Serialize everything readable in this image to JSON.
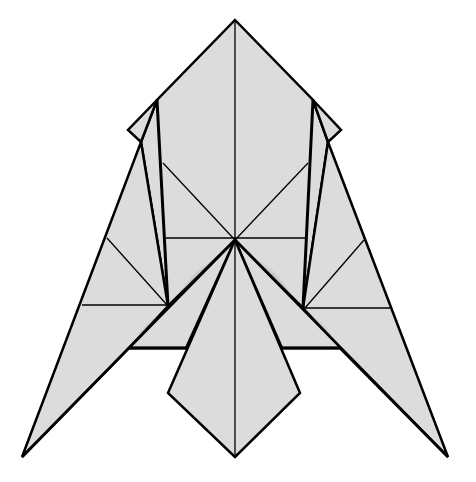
{
  "diagram": {
    "type": "origami-fold-diagram",
    "colors": {
      "paper": "#dcdcdc",
      "edge": "#000000",
      "background": "#ffffff",
      "shadow": "#9a9a9a"
    },
    "labels": []
  }
}
